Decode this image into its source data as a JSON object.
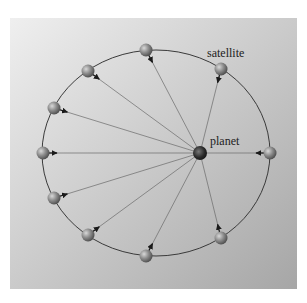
{
  "diagram": {
    "type": "orbital diagram",
    "labels": {
      "satellite": "satellite",
      "planet": "planet"
    },
    "colors": {
      "background_top": "#ececec",
      "background_bottom": "#a9a9a9",
      "orbit": "#3a3a3a",
      "force_line": "#6a6a6a",
      "satellite": "#8a8a8a",
      "planet": "#2a2a2a",
      "arrow": "#1a1a1a"
    },
    "planet": {
      "x": 200,
      "y": 153
    },
    "satellites": [
      {
        "id": "top",
        "x": 146,
        "y": 50
      },
      {
        "id": "upper-right",
        "x": 221,
        "y": 69
      },
      {
        "id": "upper-left",
        "x": 88,
        "y": 71
      },
      {
        "id": "left-upper",
        "x": 54,
        "y": 108
      },
      {
        "id": "left",
        "x": 43,
        "y": 153
      },
      {
        "id": "left-lower",
        "x": 54,
        "y": 198
      },
      {
        "id": "lower-left",
        "x": 88,
        "y": 235
      },
      {
        "id": "bottom",
        "x": 146,
        "y": 256
      },
      {
        "id": "lower-right",
        "x": 221,
        "y": 238
      },
      {
        "id": "right",
        "x": 270,
        "y": 153
      }
    ]
  }
}
